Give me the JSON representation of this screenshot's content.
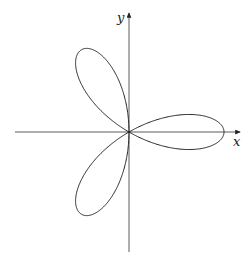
{
  "figure": {
    "x_axis_label": "x",
    "y_axis_label": "y",
    "origin_px": [
      129,
      132
    ],
    "radius_px": 95,
    "petals": 3,
    "stroke_color": "#222222"
  }
}
